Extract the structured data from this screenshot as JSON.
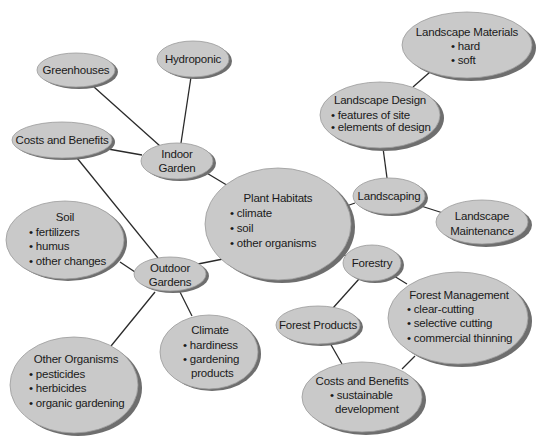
{
  "diagram": {
    "colors": {
      "node_fill": "#c9c9c9",
      "node_shadow": "#6e6e6e",
      "edge": "#2a2a2a",
      "text": "#1a1a1a",
      "background": "#ffffff"
    },
    "nodes": [
      {
        "id": "plant-habitats",
        "title": "Plant Habitats",
        "bullets": [
          "climate",
          "soil",
          "other organisms"
        ],
        "cx": 278,
        "cy": 224,
        "rx": 73,
        "ry": 56,
        "align": "left"
      },
      {
        "id": "indoor-garden",
        "title": "Indoor",
        "lines": [
          "Indoor",
          "Garden"
        ],
        "cx": 177,
        "cy": 161,
        "rx": 36,
        "ry": 18
      },
      {
        "id": "greenhouses",
        "lines": [
          "Greenhouses"
        ],
        "cx": 76,
        "cy": 70,
        "rx": 39,
        "ry": 17
      },
      {
        "id": "hydroponic",
        "lines": [
          "Hydroponic"
        ],
        "cx": 193,
        "cy": 59,
        "rx": 36,
        "ry": 18
      },
      {
        "id": "costs-benefits-indoor",
        "lines": [
          "Costs and Benefits"
        ],
        "cx": 62,
        "cy": 140,
        "rx": 50,
        "ry": 18
      },
      {
        "id": "outdoor-gardens",
        "lines": [
          "Outdoor",
          "Gardens"
        ],
        "cx": 170,
        "cy": 274,
        "rx": 36,
        "ry": 17
      },
      {
        "id": "soil",
        "title": "Soil",
        "bullets": [
          "fertilizers",
          "humus",
          "other changes"
        ],
        "cx": 65,
        "cy": 240,
        "rx": 59,
        "ry": 39,
        "align": "left"
      },
      {
        "id": "other-organisms",
        "title": "Other Organisms",
        "bullets": [
          "pesticides",
          "herbicides",
          "organic gardening"
        ],
        "cx": 74,
        "cy": 385,
        "rx": 64,
        "ry": 48,
        "align": "left"
      },
      {
        "id": "climate",
        "title": "Climate",
        "bullets": [
          "hardiness",
          "gardening products"
        ],
        "cx": 209,
        "cy": 352,
        "rx": 49,
        "ry": 37,
        "align": "left"
      },
      {
        "id": "landscaping",
        "lines": [
          "Landscaping"
        ],
        "cx": 389,
        "cy": 196,
        "rx": 36,
        "ry": 18
      },
      {
        "id": "landscape-design",
        "title": "Landscape Design",
        "bullets": [
          "features of site",
          "elements of design"
        ],
        "cx": 380,
        "cy": 115,
        "rx": 60,
        "ry": 33,
        "align": "left"
      },
      {
        "id": "landscape-materials",
        "title": "Landscape Materials",
        "bullets": [
          "hard",
          "soft"
        ],
        "cx": 467,
        "cy": 45,
        "rx": 65,
        "ry": 33,
        "align": "center"
      },
      {
        "id": "landscape-maintenance",
        "lines": [
          "Landscape",
          "Maintenance"
        ],
        "cx": 482,
        "cy": 222,
        "rx": 46,
        "ry": 22
      },
      {
        "id": "forestry",
        "lines": [
          "Forestry"
        ],
        "cx": 372,
        "cy": 263,
        "rx": 29,
        "ry": 18
      },
      {
        "id": "forest-products",
        "lines": [
          "Forest Products"
        ],
        "cx": 318,
        "cy": 325,
        "rx": 42,
        "ry": 19
      },
      {
        "id": "forest-management",
        "title": "Forest Management",
        "bullets": [
          "clear-cutting",
          "selective cutting",
          "commercial thinning"
        ],
        "cx": 458,
        "cy": 318,
        "rx": 70,
        "ry": 46,
        "align": "left"
      },
      {
        "id": "costs-benefits-forest",
        "title": "Costs and Benefits",
        "bullets": [
          "sustainable development"
        ],
        "cx": 362,
        "cy": 397,
        "rx": 60,
        "ry": 35,
        "align": "center"
      }
    ],
    "edges": [
      [
        "plant-habitats",
        "indoor-garden"
      ],
      [
        "indoor-garden",
        "greenhouses"
      ],
      [
        "indoor-garden",
        "hydroponic"
      ],
      [
        "indoor-garden",
        "costs-benefits-indoor"
      ],
      [
        "costs-benefits-indoor",
        "outdoor-gardens"
      ],
      [
        "plant-habitats",
        "outdoor-gardens"
      ],
      [
        "outdoor-gardens",
        "soil"
      ],
      [
        "outdoor-gardens",
        "other-organisms"
      ],
      [
        "outdoor-gardens",
        "climate"
      ],
      [
        "plant-habitats",
        "landscaping"
      ],
      [
        "landscaping",
        "landscape-design"
      ],
      [
        "landscape-design",
        "landscape-materials"
      ],
      [
        "landscaping",
        "landscape-maintenance"
      ],
      [
        "plant-habitats",
        "forestry"
      ],
      [
        "forestry",
        "forest-products"
      ],
      [
        "forestry",
        "forest-management"
      ],
      [
        "forest-products",
        "costs-benefits-forest"
      ],
      [
        "forest-management",
        "costs-benefits-forest"
      ]
    ]
  },
  "labels": {
    "plant_habitats": {
      "title": "Plant Habitats",
      "b1": "• climate",
      "b2": "• soil",
      "b3": "• other organisms"
    },
    "indoor_garden": {
      "l1": "Indoor",
      "l2": "Garden"
    },
    "greenhouses": {
      "l1": "Greenhouses"
    },
    "hydroponic": {
      "l1": "Hydroponic"
    },
    "costs_benefits_indoor": {
      "l1": "Costs and Benefits"
    },
    "outdoor_gardens": {
      "l1": "Outdoor",
      "l2": "Gardens"
    },
    "soil": {
      "title": "Soil",
      "b1": "• fertilizers",
      "b2": "• humus",
      "b3": "• other changes"
    },
    "other_organisms": {
      "title": "Other Organisms",
      "b1": "• pesticides",
      "b2": "• herbicides",
      "b3": "• organic gardening"
    },
    "climate": {
      "title": "Climate",
      "b1": "• hardiness",
      "b2": "• gardening",
      "b3": "products"
    },
    "landscaping": {
      "l1": "Landscaping"
    },
    "landscape_design": {
      "title": "Landscape Design",
      "b1": "• features of site",
      "b2": "• elements of design"
    },
    "landscape_materials": {
      "title": "Landscape Materials",
      "b1": "• hard",
      "b2": "• soft"
    },
    "landscape_maintenance": {
      "l1": "Landscape",
      "l2": "Maintenance"
    },
    "forestry": {
      "l1": "Forestry"
    },
    "forest_products": {
      "l1": "Forest Products"
    },
    "forest_management": {
      "title": "Forest Management",
      "b1": "• clear-cutting",
      "b2": "• selective cutting",
      "b3": "• commercial thinning"
    },
    "costs_benefits_forest": {
      "title": "Costs and Benefits",
      "b1": "• sustainable",
      "b2": "development"
    }
  }
}
